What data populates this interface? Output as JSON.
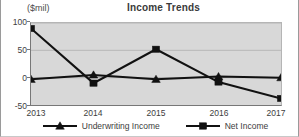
{
  "chart_data": {
    "type": "line",
    "title": "Income Trends",
    "ylabel": "($mil)",
    "xlabel": "",
    "categories": [
      "2013",
      "2014",
      "2015",
      "2016",
      "2017"
    ],
    "yticks": [
      "100",
      "50",
      "0",
      "-50"
    ],
    "ytick_values": [
      100,
      50,
      0,
      -50
    ],
    "ylim": [
      -50,
      100
    ],
    "grid": true,
    "legend_position": "bottom",
    "series": [
      {
        "name": "Underwriting Income",
        "marker": "triangle",
        "color": "#111111",
        "values": [
          -3,
          5,
          -3,
          2,
          0
        ]
      },
      {
        "name": "Net Income",
        "marker": "square",
        "color": "#111111",
        "values": [
          90,
          -10,
          52,
          -8,
          -38
        ]
      }
    ]
  }
}
